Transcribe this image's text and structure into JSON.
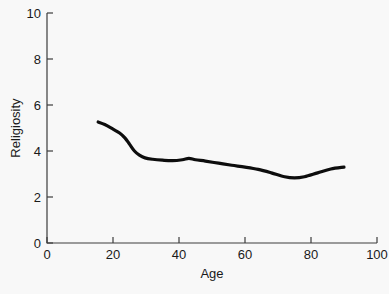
{
  "chart_data": {
    "type": "line",
    "title": "",
    "xlabel": "Age",
    "ylabel": "Religiosity",
    "xlim": [
      0,
      100
    ],
    "ylim": [
      0,
      10
    ],
    "xticks": [
      0,
      20,
      40,
      60,
      80,
      100
    ],
    "yticks": [
      0,
      2,
      4,
      6,
      8,
      10
    ],
    "xtick_labels": [
      "0",
      "20",
      "40",
      "60",
      "80",
      "100"
    ],
    "ytick_labels": [
      "0",
      "2",
      "4",
      "6",
      "8",
      "10"
    ],
    "grid": false,
    "legend": null,
    "series": [
      {
        "name": "Religiosity by age",
        "color": "#0d0d0d",
        "line_width": 3.2,
        "x": [
          15.5,
          17.5,
          20.0,
          22.0,
          23.6,
          25.0,
          26.5,
          28.0,
          29.7,
          32.0,
          35.0,
          38.0,
          41.0,
          43.0,
          45.0,
          48.0,
          52.0,
          56.0,
          60.0,
          64.0,
          68.0,
          72.0,
          75.0,
          78.0,
          82.0,
          86.0,
          90.0
        ],
        "y": [
          5.26,
          5.15,
          4.95,
          4.78,
          4.57,
          4.3,
          4.0,
          3.82,
          3.7,
          3.64,
          3.6,
          3.58,
          3.62,
          3.68,
          3.62,
          3.56,
          3.47,
          3.38,
          3.3,
          3.2,
          3.05,
          2.88,
          2.83,
          2.88,
          3.05,
          3.22,
          3.3
        ]
      }
    ]
  },
  "axis_labels": {
    "x_title": "Age",
    "y_title": "Religiosity"
  }
}
